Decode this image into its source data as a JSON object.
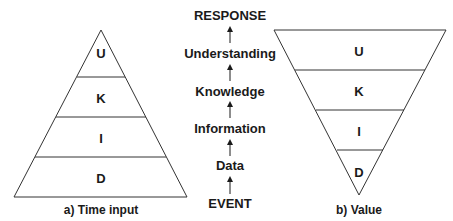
{
  "left_pyramid": {
    "caption": "a) Time input",
    "layers": [
      "U",
      "K",
      "I",
      "D"
    ]
  },
  "right_pyramid": {
    "caption": "b) Value",
    "layers": [
      "U",
      "K",
      "I",
      "D"
    ]
  },
  "hierarchy": {
    "steps": [
      "RESPONSE",
      "Understanding",
      "Knowledge",
      "Information",
      "Data",
      "EVENT"
    ]
  },
  "colors": {
    "stroke": "#333333",
    "text": "#1a1a1a"
  }
}
